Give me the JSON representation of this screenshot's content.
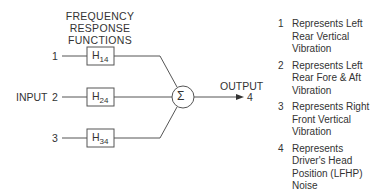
{
  "title": {
    "line1": "FREQUENCY RESPONSE",
    "line2": "FUNCTIONS"
  },
  "inputs": [
    {
      "num": "1",
      "box": "H",
      "sub": "14"
    },
    {
      "num": "2",
      "box": "H",
      "sub": "24"
    },
    {
      "num": "3",
      "box": "H",
      "sub": "34"
    }
  ],
  "input_label": "INPUT",
  "sum_symbol": "Σ",
  "output": {
    "label": "OUTPUT",
    "num": "4"
  },
  "legend": [
    {
      "num": "1",
      "text": "Represents Left Rear Vertical Vibration"
    },
    {
      "num": "2",
      "text": "Represents Left Rear Fore & Aft Vibration"
    },
    {
      "num": "3",
      "text": "Represents Right Front Vertical Vibration"
    },
    {
      "num": "4",
      "text": "Represents Driver's Head Position (LFHP) Noise"
    }
  ]
}
